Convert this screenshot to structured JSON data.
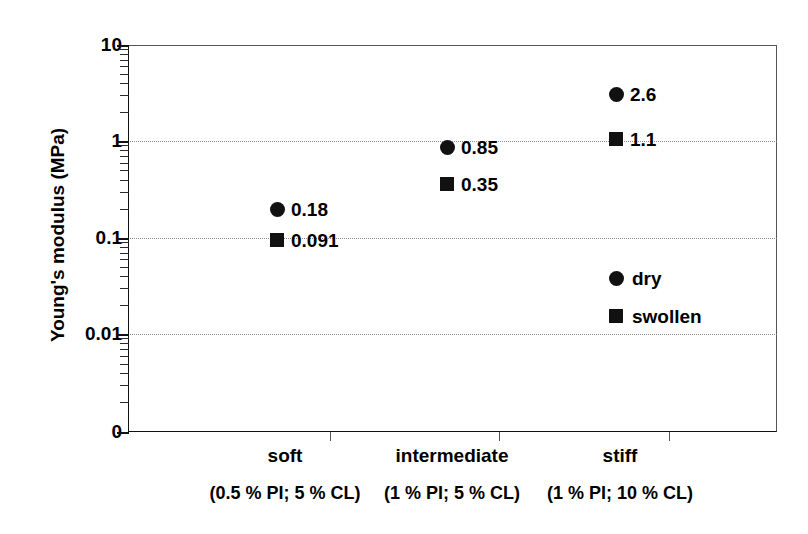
{
  "chart_data": {
    "type": "scatter",
    "title": "",
    "xlabel": "",
    "ylabel": "Young's modulus (MPa)",
    "yscale": "log",
    "ylim": [
      0.001,
      10
    ],
    "y_tick_labels": [
      "10",
      "1",
      "0.1",
      "0.01",
      "0"
    ],
    "y_tick_values": [
      10,
      1,
      0.1,
      0.01,
      0
    ],
    "grid": "horizontal-dotted",
    "legend_position": "inside-lower-right",
    "categories": [
      "soft",
      "intermediate",
      "stiff"
    ],
    "category_sublabels": [
      "(0.5 % PI; 5 % CL)",
      "(1 % PI; 5 % CL)",
      "(1 % PI; 10 % CL)"
    ],
    "series": [
      {
        "name": "dry",
        "marker": "circle",
        "color": "#111111",
        "values": [
          0.18,
          0.85,
          2.6
        ],
        "value_labels": [
          "0.18",
          "0.85",
          "2.6"
        ]
      },
      {
        "name": "swollen",
        "marker": "square",
        "color": "#111111",
        "values": [
          0.091,
          0.35,
          1.1
        ],
        "value_labels": [
          "0.091",
          "0.35",
          "1.1"
        ]
      }
    ]
  },
  "axis": {
    "y_title": "Young's modulus (MPa)",
    "ticks": [
      {
        "label": "10",
        "y": 45
      },
      {
        "label": "1",
        "y": 141
      },
      {
        "label": "0.1",
        "y": 238
      },
      {
        "label": "0.01",
        "y": 334
      },
      {
        "label": "0",
        "y": 432
      }
    ]
  },
  "points": [
    {
      "series": "dry",
      "category": "soft",
      "label": "0.18",
      "x": 277,
      "y": 209
    },
    {
      "series": "swollen",
      "category": "soft",
      "label": "0.091",
      "x": 277,
      "y": 240
    },
    {
      "series": "dry",
      "category": "intermediate",
      "label": "0.85",
      "x": 447,
      "y": 147
    },
    {
      "series": "swollen",
      "category": "intermediate",
      "label": "0.35",
      "x": 447,
      "y": 184
    },
    {
      "series": "dry",
      "category": "stiff",
      "label": "2.6",
      "x": 616,
      "y": 94
    },
    {
      "series": "swollen",
      "category": "stiff",
      "label": "1.1",
      "x": 616,
      "y": 139
    }
  ],
  "legend": [
    {
      "name": "dry",
      "marker": "circle",
      "x": 616,
      "y": 278
    },
    {
      "name": "swollen",
      "marker": "square",
      "x": 616,
      "y": 316
    }
  ],
  "xaxis_categories": [
    {
      "label": "soft",
      "sublabel": "(0.5 % PI; 5 % CL)",
      "x": 285
    },
    {
      "label": "intermediate",
      "sublabel": "(1 % PI; 5 % CL)",
      "x": 452
    },
    {
      "label": "stiff",
      "sublabel": "(1 % PI; 10 % CL)",
      "x": 620
    }
  ],
  "separators_x": [
    330,
    499,
    669
  ]
}
